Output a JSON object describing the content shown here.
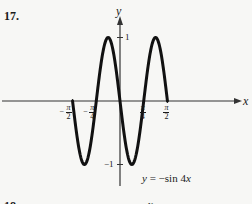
{
  "problem_number": "17.",
  "next_problem_number": "18.",
  "next_fragment": "y",
  "chart_data": {
    "type": "line",
    "title": "",
    "function_label": "y = −sin 4x",
    "function_parts": {
      "lhs": "y",
      "eq": " = −sin 4",
      "var": "x"
    },
    "xlabel": "x",
    "ylabel": "y",
    "xlim": [
      -1.5708,
      1.5708
    ],
    "ylim": [
      -1,
      1
    ],
    "grid": false,
    "legend": "none",
    "x_ticks": [
      {
        "value": -1.5708,
        "sign": "−",
        "num": "π",
        "den": "2"
      },
      {
        "value": -0.7854,
        "sign": "−",
        "num": "π",
        "den": "4"
      },
      {
        "value": 0.7854,
        "sign": "",
        "num": "π",
        "den": "4"
      },
      {
        "value": 1.5708,
        "sign": "",
        "num": "π",
        "den": "2"
      }
    ],
    "y_ticks": [
      {
        "value": 1,
        "label": "1"
      },
      {
        "value": -1,
        "label": "−1"
      }
    ],
    "series": [
      {
        "name": "y = -sin 4x",
        "expression": "-sin(4x)",
        "key_points": [
          {
            "x": -1.5708,
            "y": 0
          },
          {
            "x": -1.1781,
            "y": -1
          },
          {
            "x": -0.7854,
            "y": 0
          },
          {
            "x": -0.3927,
            "y": 1
          },
          {
            "x": 0,
            "y": 0
          },
          {
            "x": 0.3927,
            "y": -1
          },
          {
            "x": 0.7854,
            "y": 0
          },
          {
            "x": 1.1781,
            "y": 1
          },
          {
            "x": 1.5708,
            "y": 0
          }
        ]
      }
    ]
  }
}
